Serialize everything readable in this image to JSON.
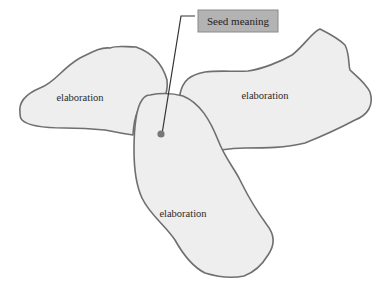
{
  "diagram": {
    "callout": {
      "label": "Seed meaning"
    },
    "blobs": [
      {
        "id": "left",
        "label": "elaboration"
      },
      {
        "id": "right",
        "label": "elaboration"
      },
      {
        "id": "bottom",
        "label": "elaboration"
      }
    ]
  }
}
